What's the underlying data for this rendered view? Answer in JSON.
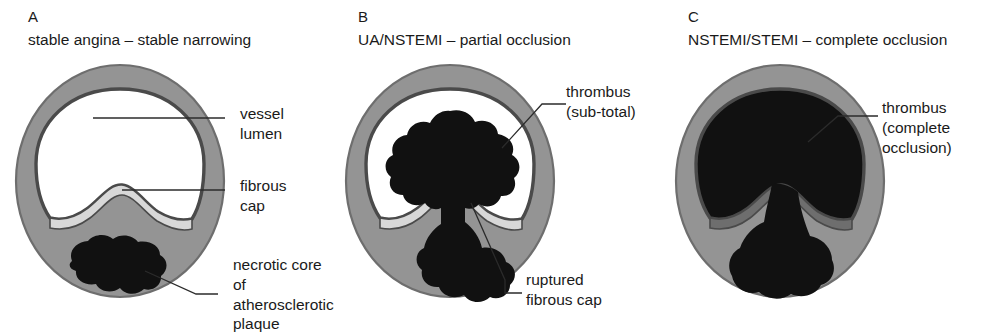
{
  "figure": {
    "type": "diagram",
    "colors": {
      "vessel_wall": "#949494",
      "wall_outline": "#6e6e6e",
      "intima_line": "#4a4a4a",
      "lumen": "#ffffff",
      "thrombus": "#111111",
      "fibrous_cap": "#d8d8d8",
      "text": "#1a1a1a",
      "leader_line": "#2b2b2b",
      "background": "#ffffff"
    }
  },
  "panels": [
    {
      "letter": "A",
      "caption": "stable angina – stable narrowing",
      "labels": [
        {
          "id": "vessel-lumen",
          "text": "vessel\nlumen"
        },
        {
          "id": "fibrous-cap",
          "text": "fibrous\ncap"
        },
        {
          "id": "necrotic-core",
          "text": "necrotic core of\natherosclerotic\nplaque"
        }
      ]
    },
    {
      "letter": "B",
      "caption": "UA/NSTEMI – partial occlusion",
      "labels": [
        {
          "id": "thrombus-subtotal",
          "text": "thrombus\n(sub-total)"
        },
        {
          "id": "ruptured-fibrous-cap",
          "text": "ruptured\nfibrous cap"
        }
      ]
    },
    {
      "letter": "C",
      "caption": "NSTEMI/STEMI – complete occlusion",
      "labels": [
        {
          "id": "thrombus-complete",
          "text": "thrombus\n(complete\nocclusion)"
        }
      ]
    }
  ]
}
